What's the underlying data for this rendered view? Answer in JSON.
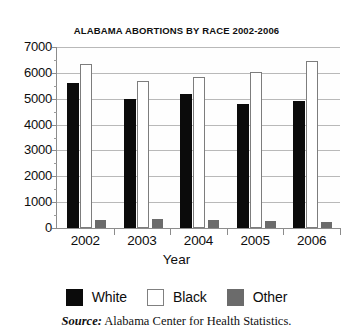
{
  "chart_data": {
    "type": "bar",
    "title": "ALABAMA ABORTIONS BY RACE 2002-2006",
    "xlabel": "Year",
    "ylabel": "",
    "categories": [
      "2002",
      "2003",
      "2004",
      "2005",
      "2006"
    ],
    "series": [
      {
        "name": "White",
        "color": "#0b0b0b",
        "values": [
          5600,
          5000,
          5200,
          4800,
          4900
        ]
      },
      {
        "name": "Black",
        "color": "#ffffff",
        "values": [
          6350,
          5700,
          5850,
          6050,
          6450
        ]
      },
      {
        "name": "Other",
        "color": "#6b6b6b",
        "values": [
          300,
          330,
          300,
          280,
          220
        ]
      }
    ],
    "ylim": [
      0,
      7000
    ],
    "ytick_labels": [
      "7000",
      "6000",
      "5000",
      "4000",
      "3000",
      "2000",
      "1000",
      "0"
    ],
    "ytick_values": [
      7000,
      6000,
      5000,
      4000,
      3000,
      2000,
      1000,
      0
    ],
    "yminor_step": 500,
    "grid": true,
    "legend_position": "bottom"
  },
  "legend": {
    "items": [
      {
        "label": "White",
        "swatch": "solid-black-swatch"
      },
      {
        "label": "Black",
        "swatch": "hollow-white-swatch"
      },
      {
        "label": "Other",
        "swatch": "solid-grey-swatch"
      }
    ]
  },
  "source": {
    "prefix": "Source:",
    "text": "Alabama Center for Health Statistics."
  }
}
